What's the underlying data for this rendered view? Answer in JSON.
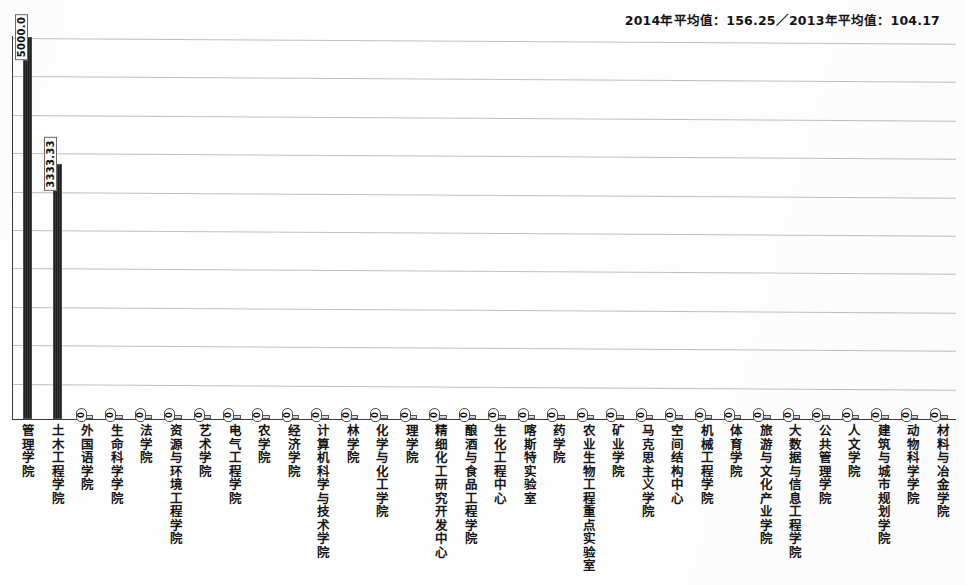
{
  "header": {
    "note": "2014年平均值：156.25／2013年平均值：104.17"
  },
  "axis": {
    "gridline_count": 10,
    "baseline_value": 0,
    "max_value": 5000
  },
  "chart_data": {
    "type": "bar",
    "title": "",
    "subtitle": "2014年平均值：156.25／2013年平均值：104.17",
    "xlabel": "",
    "ylabel": "",
    "ylim": [
      0,
      5000
    ],
    "grid": true,
    "legend": "none",
    "categories": [
      "管理学院",
      "土木工程学院",
      "外国语学院",
      "生命科学学院",
      "法学院",
      "资源与环境工程学院",
      "艺术学院",
      "电气工程学院",
      "农学院",
      "经济学院",
      "计算机科学与技术学院",
      "林学院",
      "化学与化工学院",
      "理学院",
      "精细化工研究开发中心",
      "酿酒与食品工程学院",
      "生化工程中心",
      "喀斯特实验室",
      "药学院",
      "农业生物工程重点实验室",
      "矿业学院",
      "马克思主义学院",
      "空间结构中心",
      "机械工程学院",
      "体育学院",
      "旅游与文化产业学院",
      "大数据与信息工程学院",
      "公共管理学院",
      "人文学院",
      "建筑与城市规划学院",
      "动物科学学院",
      "材料与冶金学院"
    ],
    "values": [
      5000,
      3333.33,
      0,
      0,
      0,
      0,
      0,
      0,
      0,
      0,
      0,
      0,
      0,
      0,
      0,
      0,
      0,
      0,
      0,
      0,
      0,
      0,
      0,
      0,
      0,
      0,
      0,
      0,
      0,
      0,
      0,
      0
    ],
    "value_labels": [
      "5000.0",
      "3333.33",
      "0",
      "0",
      "0",
      "0",
      "0",
      "0",
      "0",
      "0",
      "0",
      "0",
      "0",
      "0",
      "0",
      "0",
      "0",
      "0",
      "0",
      "0",
      "0",
      "0",
      "0",
      "0",
      "0",
      "0",
      "0",
      "0",
      "0",
      "0",
      "0",
      "0"
    ]
  }
}
